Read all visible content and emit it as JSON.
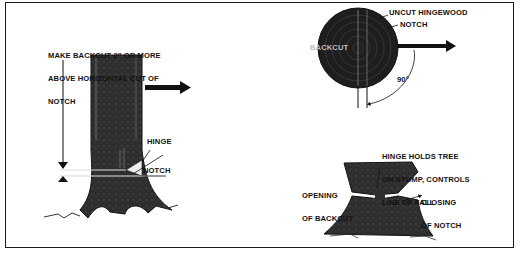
{
  "figure": {
    "panels": {
      "side_view": {
        "backcut_instruction": [
          "MAKE BACKCUT 2″ OR MORE",
          "ABOVE HORIZONTAL CUT OF",
          "NOTCH"
        ],
        "hinge_label": "HINGE",
        "notch_label": "NOTCH",
        "fall_direction_icon": "arrow-right-icon"
      },
      "top_view": {
        "uncut_hingewood_label": "UNCUT HINGEWOOD",
        "notch_label": "NOTCH",
        "backcut_label": "BACKCUT",
        "angle_label": "90°",
        "fall_direction_icon": "arrow-right-icon"
      },
      "falling_view": {
        "hinge_holds_label": [
          "HINGE HOLDS TREE",
          "ON STUMP, CONTROLS",
          "LINE OF FALL"
        ],
        "opening_label": [
          "OPENING",
          "OF BACKCUT"
        ],
        "closing_label": [
          "CLOSING",
          "OF NOTCH"
        ]
      }
    },
    "colors": {
      "ink": "#111111",
      "paper": "#ffffff",
      "bark": "#2b2b2b"
    }
  }
}
